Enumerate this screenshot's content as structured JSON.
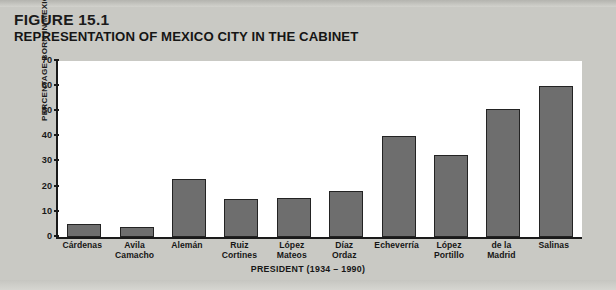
{
  "figure": {
    "number_label": "FIGURE 15.1",
    "number_prefix": "F",
    "number_rest": "IGURE",
    "number_value": "15.1",
    "title": "REPRESENTATION OF MEXICO CITY IN THE CABINET"
  },
  "colors": {
    "page_background": "#c9c9c4",
    "plot_background": "#ffffff",
    "bar_fill": "#6e6e6e",
    "bar_outline": "#232323",
    "axis": "#1a1a1a",
    "text": "#161616"
  },
  "chart_data": {
    "type": "bar",
    "title": "REPRESENTATION OF MEXICO CITY IN THE CABINET",
    "subtitle": "FIGURE 15.1",
    "xlabel": "PRESIDENT (1934 – 1990)",
    "ylabel": "PERCENTAGE BORN IN MEXICO CITY",
    "ylim": [
      0,
      70
    ],
    "yticks": [
      0,
      10,
      20,
      30,
      40,
      50,
      60,
      70
    ],
    "ytick_labels": [
      "0",
      "10",
      "20",
      "30",
      "40",
      "50",
      "60",
      "70"
    ],
    "grid": false,
    "legend": false,
    "categories": [
      "Cárdenas",
      "Avila Camacho",
      "Alemán",
      "Ruiz Cortines",
      "López Mateos",
      "Díaz Ordaz",
      "Echeverría",
      "López Portillo",
      "de la Madrid",
      "Salinas"
    ],
    "category_lines": [
      [
        "Cárdenas"
      ],
      [
        "Avila",
        "Camacho"
      ],
      [
        "Alemán"
      ],
      [
        "Ruiz",
        "Cortines"
      ],
      [
        "López",
        "Mateos"
      ],
      [
        "Díaz",
        "Ordaz"
      ],
      [
        "Echeverría"
      ],
      [
        "López",
        "Portillo"
      ],
      [
        "de la",
        "Madrid"
      ],
      [
        "Salinas"
      ]
    ],
    "values": [
      5,
      4,
      23,
      15,
      15.5,
      18.5,
      40,
      32.5,
      51,
      60
    ]
  }
}
